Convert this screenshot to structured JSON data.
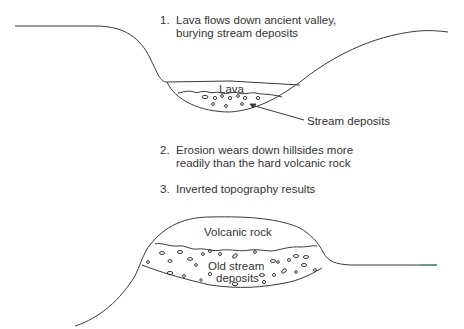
{
  "diagram": {
    "steps": [
      {
        "num": "1.",
        "line1": "Lava flows down ancient valley,",
        "line2": "burying stream deposits"
      },
      {
        "num": "2.",
        "line1": "Erosion wears down hillsides more",
        "line2": "readily than the hard volcanic rock"
      },
      {
        "num": "3.",
        "line1": "Inverted topography results",
        "line2": ""
      }
    ],
    "labels": {
      "lava": "Lava",
      "stream_deposits": "Stream deposits",
      "volcanic_rock": "Volcanic rock",
      "old_stream_1": "Old stream",
      "old_stream_2": "deposits"
    },
    "colors": {
      "line": "#3a3a3a",
      "text": "#333333",
      "background": "#ffffff",
      "ground_accent": "#3f8f6a"
    }
  }
}
